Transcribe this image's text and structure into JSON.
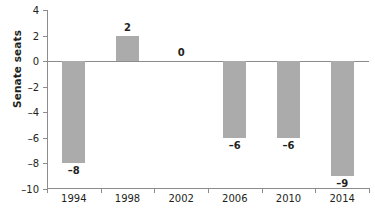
{
  "chart_data": {
    "type": "bar",
    "title": "",
    "xlabel": "",
    "ylabel": "Senate seats",
    "categories": [
      "1994",
      "1998",
      "2002",
      "2006",
      "2010",
      "2014"
    ],
    "values": [
      -8,
      2,
      0,
      -6,
      -6,
      -9
    ],
    "value_labels": [
      "–8",
      "2",
      "0",
      "–6",
      "–6",
      "–9"
    ],
    "series": [
      {
        "name": "Senate seats",
        "values": [
          -8,
          2,
          0,
          -6,
          -6,
          -9
        ]
      }
    ],
    "ylim": [
      -10,
      4
    ],
    "yticks": [
      4,
      2,
      0,
      -2,
      -4,
      -6,
      -8,
      -10
    ],
    "ytick_labels": [
      "4",
      "2",
      "0",
      "–2",
      "–4",
      "–6",
      "–8",
      "–10"
    ],
    "grid": false,
    "legend": false,
    "zero_line": true,
    "bar_color": "#ababab",
    "axis_color": "#8c8c8c",
    "text_color": "#231f20",
    "background": "#ffffff"
  }
}
